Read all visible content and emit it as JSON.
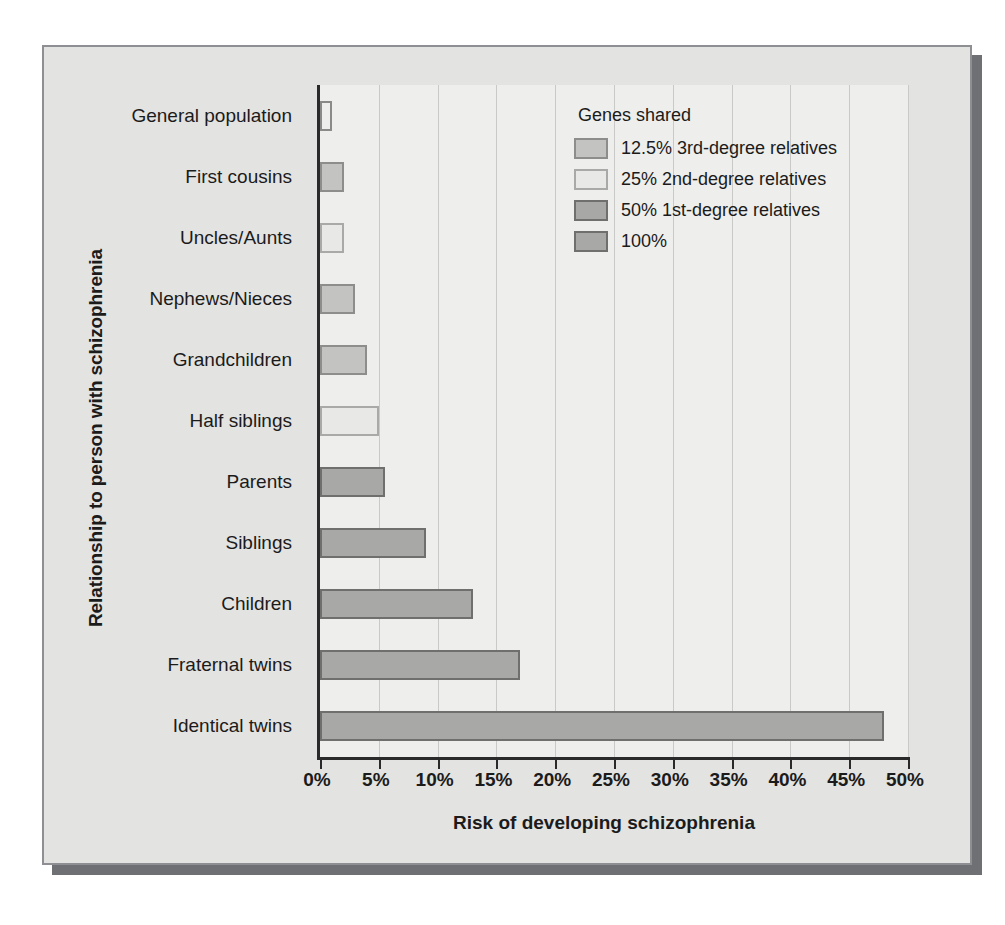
{
  "chart_data": {
    "type": "bar",
    "orientation": "horizontal",
    "title": "",
    "xlabel": "Risk of developing schizophrenia",
    "ylabel": "Relationship to person with schizophrenia",
    "xlim": [
      0,
      50
    ],
    "xtick_labels": [
      "0%",
      "5%",
      "10%",
      "15%",
      "20%",
      "25%",
      "30%",
      "35%",
      "40%",
      "45%",
      "50%"
    ],
    "xtick_values": [
      0,
      5,
      10,
      15,
      20,
      25,
      30,
      35,
      40,
      45,
      50
    ],
    "grid": true,
    "legend_position": "top-right",
    "categories": [
      "General population",
      "First cousins",
      "Uncles/Aunts",
      "Nephews/Nieces",
      "Grandchildren",
      "Half siblings",
      "Parents",
      "Siblings",
      "Children",
      "Fraternal twins",
      "Identical twins"
    ],
    "values": [
      1,
      2,
      2,
      3,
      4,
      5,
      5.5,
      9,
      13,
      17,
      48
    ],
    "value_groups": [
      "100",
      "s125",
      "s25",
      "s125",
      "s125",
      "s25",
      "s50",
      "s50",
      "s50",
      "s50",
      "s100"
    ],
    "legend": {
      "title": "Genes shared",
      "entries": [
        {
          "key": "s125",
          "label": "12.5% 3rd-degree relatives",
          "color": "#c3c3c1"
        },
        {
          "key": "s25",
          "label": "25% 2nd-degree relatives",
          "color": "#e8e8e6"
        },
        {
          "key": "s50",
          "label": "50% 1st-degree relatives",
          "color": "#a8a8a6"
        },
        {
          "key": "s100",
          "label": "100%",
          "color": "#a8a8a6"
        }
      ]
    },
    "colors": {
      "plot_background": "#eeeeec",
      "figure_background": "#e3e3e1",
      "frame_border": "#8d8f92",
      "shadow": "#6e7073",
      "axis": "#2a2a2a",
      "gridline": "#c9c9c7",
      "text": "#1b1b1b"
    }
  }
}
